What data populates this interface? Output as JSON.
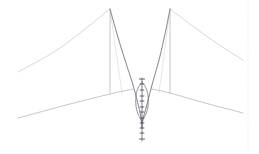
{
  "canvas": {
    "width": 259,
    "height": 154,
    "background": "#ffffff",
    "title": "structural-line-drawing"
  },
  "palette": {
    "background": "#ffffff",
    "cable_light": "#c9c9cf",
    "cable_mid": "#b2b2ba",
    "main_cable": "#8d8d98",
    "main_cable_dark": "#6f6f7c",
    "tower": "#c2c2c8",
    "deck": "#b8b8c0",
    "lattice": "#5f5f6b",
    "lattice_light": "#9a9aa6",
    "tick": "#3d3d48",
    "guide_dotted": "#e2e2e8"
  },
  "chart_data": {
    "type": "line",
    "title": "",
    "xlabel": "",
    "ylabel": "",
    "xlim": [
      0,
      259
    ],
    "ylim": [
      0,
      154
    ],
    "grid": false,
    "legend": null,
    "series": [
      {
        "name": "left-backstay-cable",
        "comment": "long diagonal from left tower apex down to left edge",
        "points": [
          [
            110,
            9
          ],
          [
            60,
            48
          ],
          [
            18,
            72
          ]
        ]
      },
      {
        "name": "left-tower-mast",
        "comment": "vertical tower shaft left",
        "points": [
          [
            110,
            9
          ],
          [
            110,
            93
          ]
        ]
      },
      {
        "name": "left-tower-inner-stay",
        "comment": "faint stay from apex to deck inside span",
        "points": [
          [
            110,
            9
          ],
          [
            122,
            93
          ]
        ]
      },
      {
        "name": "main-cable-left-half",
        "comment": "dark catenary from left apex dipping to centre low point",
        "points": [
          [
            110,
            9
          ],
          [
            117,
            34
          ],
          [
            125,
            60
          ],
          [
            133,
            85
          ],
          [
            139,
            108
          ],
          [
            142,
            122
          ]
        ]
      },
      {
        "name": "main-cable-right-half",
        "comment": "dark catenary from centre low point rising to right apex",
        "points": [
          [
            142,
            122
          ],
          [
            146,
            108
          ],
          [
            152,
            85
          ],
          [
            159,
            60
          ],
          [
            165,
            34
          ],
          [
            170,
            9
          ]
        ]
      },
      {
        "name": "right-tower-mast",
        "comment": "vertical tower shaft right",
        "points": [
          [
            170,
            9
          ],
          [
            170,
            93
          ]
        ]
      },
      {
        "name": "right-tower-inner-stay",
        "comment": "faint stay from apex to deck inside span",
        "points": [
          [
            170,
            9
          ],
          [
            159,
            93
          ]
        ]
      },
      {
        "name": "right-backstay-cable",
        "comment": "long diagonal from right tower apex down to right edge",
        "points": [
          [
            170,
            9
          ],
          [
            212,
            40
          ],
          [
            243,
            60
          ]
        ]
      },
      {
        "name": "left-deck-line",
        "comment": "near-horizontal deck / roadway left of centre",
        "points": [
          [
            18,
            118
          ],
          [
            70,
            104
          ],
          [
            110,
            94
          ],
          [
            133,
            89
          ]
        ]
      },
      {
        "name": "right-deck-line",
        "comment": "near-horizontal deck / roadway right of centre",
        "points": [
          [
            152,
            89
          ],
          [
            170,
            93
          ],
          [
            205,
            103
          ],
          [
            243,
            113
          ]
        ]
      },
      {
        "name": "centre-lattice-outline-left",
        "comment": "elongated needle / lattice body left edge",
        "points": [
          [
            142,
            82
          ],
          [
            138,
            88
          ],
          [
            136,
            96
          ],
          [
            136,
            106
          ],
          [
            138,
            114
          ],
          [
            141,
            120
          ],
          [
            142,
            128
          ]
        ]
      },
      {
        "name": "centre-lattice-outline-right",
        "comment": "elongated needle / lattice body right edge",
        "points": [
          [
            142,
            82
          ],
          [
            146,
            88
          ],
          [
            148,
            96
          ],
          [
            148,
            106
          ],
          [
            146,
            114
          ],
          [
            143,
            120
          ],
          [
            142,
            128
          ]
        ]
      },
      {
        "name": "centre-spine",
        "comment": "vertical spine through lattice with tick nodes",
        "points": [
          [
            142,
            78
          ],
          [
            142,
            141
          ]
        ]
      }
    ],
    "markers": {
      "name": "spine-tick-nodes",
      "comment": "small cross/tick marks along the central vertical spine",
      "x": 142,
      "y_values": [
        79,
        84,
        90,
        96,
        101,
        107,
        112,
        118,
        123,
        128,
        133,
        139
      ]
    },
    "annotations": [
      {
        "name": "right-dotted-guide",
        "type": "vertical-dotted-line",
        "x": 248,
        "y0": 2,
        "y1": 152
      }
    ]
  },
  "figure": {
    "description": "Faint technical line drawing of a cable-stayed / suspension structure: two vertical towers with diagonal backstays, a dark catenary main cable sagging between them, near-horizontal deck lines, and a slender central lattice needle with tick nodes."
  }
}
